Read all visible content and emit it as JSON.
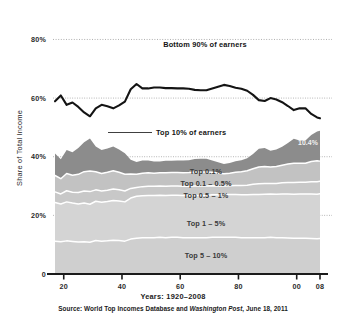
{
  "chart_data": {
    "type": "area",
    "title": "",
    "xlabel": "Years: 1920–2008",
    "ylabel": "Share of Total Income",
    "xlim": [
      1917,
      2008
    ],
    "ylim": [
      0,
      88
    ],
    "grid": true,
    "legend_position": "inline-labels",
    "x_tick_labels": [
      "20",
      "40",
      "60",
      "80",
      "00",
      "08"
    ],
    "x_tick_years": [
      1920,
      1940,
      1960,
      1980,
      2000,
      2008
    ],
    "y_tick_labels": [
      "0",
      "20%",
      "40%",
      "60%",
      "80%"
    ],
    "y_tick_values": [
      0,
      20,
      40,
      60,
      80
    ],
    "x": [
      1917,
      1919,
      1921,
      1923,
      1925,
      1927,
      1929,
      1931,
      1933,
      1935,
      1937,
      1939,
      1941,
      1943,
      1945,
      1947,
      1949,
      1951,
      1953,
      1955,
      1957,
      1959,
      1961,
      1963,
      1965,
      1967,
      1969,
      1971,
      1973,
      1975,
      1977,
      1979,
      1981,
      1983,
      1985,
      1987,
      1989,
      1991,
      1993,
      1995,
      1997,
      1999,
      2001,
      2003,
      2005,
      2007,
      2008
    ],
    "series": [
      {
        "name": "Top 5 – 10%",
        "stack_order": 1,
        "color": "#cfcfcf",
        "values": [
          11.2,
          11.0,
          11.3,
          11.1,
          10.9,
          11.0,
          10.8,
          11.4,
          11.2,
          11.3,
          11.5,
          11.4,
          11.2,
          11.9,
          12.2,
          12.4,
          12.4,
          12.4,
          12.5,
          12.4,
          12.5,
          12.5,
          12.4,
          12.4,
          12.4,
          12.4,
          12.4,
          12.5,
          12.5,
          12.5,
          12.5,
          12.5,
          12.4,
          12.4,
          12.4,
          12.4,
          12.4,
          12.5,
          12.4,
          12.4,
          12.3,
          12.2,
          12.2,
          12.2,
          12.1,
          12.0,
          12.1
        ]
      },
      {
        "name": "Top 1 – 5%",
        "stack_order": 2,
        "color": "#d4d4d4",
        "values": [
          13.2,
          12.9,
          13.3,
          13.1,
          13.0,
          13.2,
          13.0,
          13.4,
          13.3,
          13.4,
          13.6,
          13.5,
          13.4,
          14.0,
          14.3,
          14.3,
          14.4,
          14.4,
          14.4,
          14.4,
          14.4,
          14.4,
          14.4,
          14.4,
          14.4,
          14.4,
          14.4,
          14.5,
          14.5,
          14.6,
          14.6,
          14.6,
          14.6,
          14.6,
          14.7,
          14.7,
          14.8,
          14.8,
          14.8,
          14.9,
          15.0,
          15.0,
          15.1,
          15.1,
          15.2,
          15.2,
          15.3
        ]
      },
      {
        "name": "Top 0.5 – 1%",
        "stack_order": 3,
        "color": "#c8c8c8",
        "values": [
          3.6,
          3.4,
          3.8,
          3.7,
          3.9,
          4.1,
          4.3,
          3.9,
          3.8,
          3.9,
          3.9,
          3.8,
          3.7,
          3.3,
          3.0,
          3.1,
          3.1,
          3.1,
          3.1,
          3.1,
          3.1,
          3.1,
          3.1,
          3.1,
          3.2,
          3.2,
          3.2,
          3.1,
          3.0,
          2.9,
          3.0,
          3.1,
          3.2,
          3.3,
          3.5,
          3.7,
          3.7,
          3.6,
          3.7,
          3.8,
          3.9,
          4.0,
          4.0,
          4.0,
          4.2,
          4.3,
          4.2
        ]
      },
      {
        "name": "Top 0.1 – 0.5%",
        "stack_order": 4,
        "color": "#c2c2c2",
        "values": [
          5.6,
          5.2,
          5.9,
          5.8,
          6.2,
          6.6,
          7.0,
          6.2,
          6.0,
          6.1,
          6.2,
          6.0,
          5.7,
          4.9,
          4.5,
          4.6,
          4.6,
          4.5,
          4.5,
          4.6,
          4.6,
          4.6,
          4.6,
          4.7,
          4.8,
          4.8,
          4.8,
          4.6,
          4.4,
          4.2,
          4.3,
          4.5,
          4.7,
          4.9,
          5.3,
          5.7,
          5.8,
          5.6,
          5.8,
          6.0,
          6.3,
          6.6,
          6.5,
          6.5,
          6.9,
          7.1,
          6.9
        ]
      },
      {
        "name": "Top 0.1%",
        "stack_order": 5,
        "color": "#8c8c8c",
        "values": [
          7.5,
          6.6,
          8.0,
          7.8,
          9.0,
          10.0,
          11.1,
          8.6,
          8.0,
          8.1,
          8.3,
          7.8,
          7.2,
          4.9,
          4.2,
          4.3,
          4.2,
          4.0,
          3.9,
          4.1,
          4.0,
          4.1,
          4.2,
          4.2,
          4.4,
          4.5,
          4.5,
          4.0,
          3.7,
          3.3,
          3.5,
          3.8,
          3.9,
          4.3,
          5.0,
          6.2,
          6.3,
          5.5,
          5.8,
          6.3,
          7.2,
          8.3,
          7.7,
          7.7,
          9.0,
          10.0,
          10.4
        ]
      }
    ],
    "top_line": {
      "name": "Bottom 90% of earners",
      "color": "#141414",
      "values": [
        58.9,
        60.9,
        57.7,
        58.5,
        57.0,
        55.1,
        53.8,
        56.5,
        57.7,
        57.2,
        56.5,
        57.5,
        58.8,
        63.0,
        64.8,
        63.3,
        63.3,
        63.6,
        63.6,
        63.4,
        63.4,
        63.3,
        63.3,
        63.2,
        62.8,
        62.7,
        62.7,
        63.3,
        63.9,
        64.5,
        64.1,
        63.5,
        63.2,
        62.5,
        61.1,
        59.3,
        59.0,
        60.0,
        59.5,
        58.6,
        57.3,
        55.9,
        56.5,
        56.5,
        54.6,
        53.4,
        53.1
      ]
    },
    "annotations": [
      {
        "name": "bottom-90-label",
        "text": "Bottom 90% of earners"
      },
      {
        "name": "top-10-label",
        "text": "Top 10% of earners"
      },
      {
        "name": "top-01-value",
        "text": "10.4%"
      }
    ]
  },
  "axis": {
    "y_title": "Share of Total Income",
    "y_ticks": [
      "80%",
      "60%",
      "40%",
      "20%",
      "0"
    ],
    "x_ticks": [
      "20",
      "40",
      "60",
      "80",
      "00",
      "08"
    ]
  },
  "labels": {
    "bottom_90": "Bottom 90% of earners",
    "top_10": "Top 10% of earners",
    "top_01": "Top 0.1%",
    "top_01_05": "Top 0.1 – 0.5%",
    "top_05_1": "Top 0.5 – 1%",
    "top_1_5": "Top 1 – 5%",
    "top_5_10": "Top 5 – 10%",
    "value_104": "10.4%"
  },
  "caption": {
    "years": "Years: 1920–2008",
    "source_prefix": "Source: World Top Incomes Database and ",
    "source_italic": "Washington Post",
    "source_suffix": ", June 18, 2011"
  },
  "colors": {
    "band_top_01": "#8c8c8c",
    "band_top_01_05": "#c2c2c2",
    "band_top_05_1": "#c8c8c8",
    "band_top_1_5": "#d4d4d4",
    "band_top_5_10": "#cfcfcf",
    "line_bottom_90": "#141414",
    "axis": "#1b1b1b",
    "gridline": "#9a9a9a",
    "separator": "#ffffff",
    "background": "#ffffff"
  }
}
